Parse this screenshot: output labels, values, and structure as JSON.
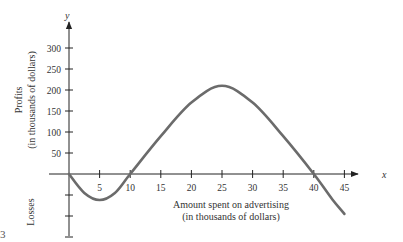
{
  "chart_data": {
    "type": "line",
    "title": "",
    "xlabel": "Amount spent on advertising (in thousands of dollars)",
    "xlabel_lines": [
      "Amount spent on advertising",
      "(in thousands of dollars)"
    ],
    "ylabel_lines": [
      "Profits",
      "(in thousands of dollars)"
    ],
    "ylabel_negative": "Losses",
    "x_axis_var": "x",
    "y_axis_var": "y",
    "x_ticks": [
      5,
      10,
      15,
      20,
      25,
      30,
      35,
      40,
      45
    ],
    "y_ticks": [
      50,
      100,
      150,
      200,
      250,
      300
    ],
    "y_negative_ticks": [
      -50,
      -100,
      -150
    ],
    "xlim": [
      0,
      49
    ],
    "ylim": [
      -160,
      330
    ],
    "grid": false,
    "legend": null,
    "series": [
      {
        "name": "Profit",
        "x": [
          0,
          2.5,
          5,
          7.5,
          10,
          15,
          20,
          25,
          30,
          35,
          40,
          43,
          45
        ],
        "y": [
          0,
          -45,
          -62,
          -45,
          0,
          90,
          170,
          210,
          170,
          90,
          0,
          -60,
          -95
        ]
      }
    ]
  },
  "figure_label": "3"
}
